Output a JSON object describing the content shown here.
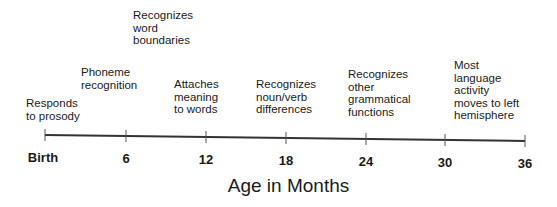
{
  "timeline": {
    "axis_title": "Age in Months",
    "ticks": [
      {
        "label": "Birth",
        "x": 45
      },
      {
        "label": "6",
        "x": 126
      },
      {
        "label": "12",
        "x": 206
      },
      {
        "label": "18",
        "x": 286
      },
      {
        "label": "24",
        "x": 366
      },
      {
        "label": "30",
        "x": 445
      },
      {
        "label": "36",
        "x": 525
      }
    ],
    "milestones": [
      {
        "text": "Responds\nto prosody",
        "x": 28,
        "y": 97
      },
      {
        "text": "Phoneme\nrecognition",
        "x": 83,
        "y": 66
      },
      {
        "text": "Recognizes\nword\nboundaries",
        "x": 135,
        "y": 9
      },
      {
        "text": "Attaches\nmeaning\nto words",
        "x": 176,
        "y": 78
      },
      {
        "text": "Recognizes\nnoun/verb\ndifferences",
        "x": 258,
        "y": 78
      },
      {
        "text": "Recognizes\nother\ngrammatical\nfunctions",
        "x": 350,
        "y": 68
      },
      {
        "text": "Most\nlanguage\nactivity\nmoves to left\nhemisphere",
        "x": 456,
        "y": 59
      }
    ]
  }
}
